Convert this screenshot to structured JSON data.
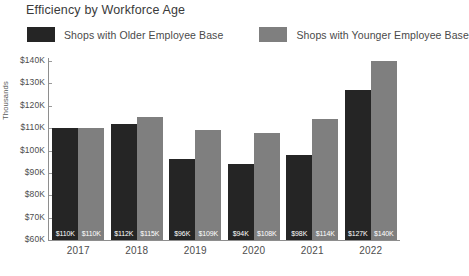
{
  "chart_data": {
    "type": "bar",
    "title": "Efficiency by Workforce Age",
    "xlabel": "",
    "ylabel": "Thousands",
    "categories": [
      "2017",
      "2018",
      "2019",
      "2020",
      "2021",
      "2022"
    ],
    "series": [
      {
        "name": "Shops with Older Employee Base",
        "color": "#252525",
        "values": [
          110000,
          112000,
          96000,
          94000,
          98000,
          127000
        ],
        "labels": [
          "$110K",
          "$112K",
          "$96K",
          "$94K",
          "$98K",
          "$127K"
        ]
      },
      {
        "name": "Shops with Younger Employee Base",
        "color": "#7f7f7f",
        "values": [
          110000,
          115000,
          109000,
          108000,
          114000,
          140000
        ],
        "labels": [
          "$110K",
          "$115K",
          "$109K",
          "$108K",
          "$114K",
          "$140K"
        ]
      }
    ],
    "ylim": [
      60000,
      140000
    ],
    "yticks": [
      140000,
      130000,
      120000,
      110000,
      100000,
      90000,
      80000,
      70000,
      60000
    ],
    "ytick_labels": [
      "$140K",
      "$130K",
      "$120K",
      "$110K",
      "$100K",
      "$90K",
      "$80K",
      "$70K",
      "$60K"
    ],
    "grid": false,
    "legend_position": "top-left",
    "data_labels_inside_bars": true
  },
  "legend": {
    "entries": [
      {
        "label": "Shops with Older Employee Base",
        "color": "#252525"
      },
      {
        "label": "Shops with Younger Employee Base",
        "color": "#7f7f7f"
      }
    ]
  },
  "axis": {
    "y_title": "Thousands"
  }
}
